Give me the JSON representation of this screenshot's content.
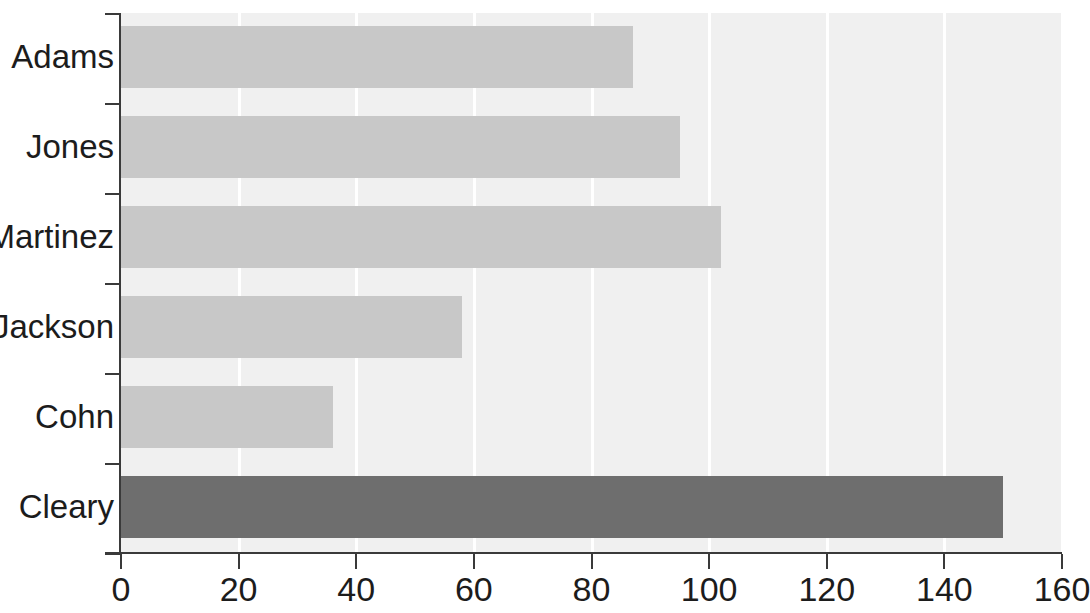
{
  "chart_data": {
    "type": "bar",
    "orientation": "horizontal",
    "title": "",
    "xlabel": "",
    "ylabel": "",
    "categories": [
      "Adams",
      "Jones",
      "Martinez",
      "Jackson",
      "Cohn",
      "Cleary"
    ],
    "values": [
      87,
      95,
      102,
      58,
      36,
      150
    ],
    "xlim": [
      0,
      160
    ],
    "xticks": [
      0,
      20,
      40,
      60,
      80,
      100,
      120,
      140,
      160
    ],
    "xtick_labels": [
      "0",
      "20",
      "40",
      "60",
      "80",
      "100",
      "120",
      "140",
      "160"
    ],
    "grid": true,
    "grid_axis": "x",
    "grid_color": "#ffffff",
    "legend": false,
    "plot_background": "#f0f0f0",
    "bar_color": "#c8c8c8",
    "highlight_color": "#6e6e6e",
    "highlighted_categories": [
      "Cleary"
    ],
    "axis_color": "#3a3a3a",
    "bars": [
      {
        "label": "Adams",
        "value": 87,
        "color": "#c8c8c8",
        "highlighted": false
      },
      {
        "label": "Jones",
        "value": 95,
        "color": "#c8c8c8",
        "highlighted": false
      },
      {
        "label": "Martinez",
        "value": 102,
        "color": "#c8c8c8",
        "highlighted": false
      },
      {
        "label": "Jackson",
        "value": 58,
        "color": "#c8c8c8",
        "highlighted": false
      },
      {
        "label": "Cohn",
        "value": 36,
        "color": "#c8c8c8",
        "highlighted": false
      },
      {
        "label": "Cleary",
        "value": 150,
        "color": "#6e6e6e",
        "highlighted": true
      }
    ]
  }
}
